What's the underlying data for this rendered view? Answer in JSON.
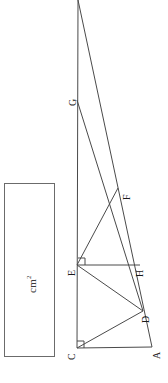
{
  "figure": {
    "stroke_color": "#4a4a4a",
    "background_color": "#ffffff",
    "rotation_degrees": -90,
    "vertices": [
      {
        "id": "T",
        "label": "",
        "x": 78,
        "y": 0,
        "label_x": 0,
        "label_y": 0,
        "shown": false
      },
      {
        "id": "G",
        "label": "G",
        "x": 77,
        "y": 100,
        "label_x": 68,
        "label_y": 106,
        "shown": true
      },
      {
        "id": "F",
        "label": "F",
        "x": 118,
        "y": 188,
        "label_x": 122,
        "label_y": 200,
        "shown": true
      },
      {
        "id": "E",
        "label": "E",
        "x": 77,
        "y": 265,
        "label_x": 67,
        "label_y": 276,
        "shown": true
      },
      {
        "id": "H",
        "label": "H",
        "x": 140,
        "y": 265,
        "label_x": 135,
        "label_y": 277,
        "shown": true
      },
      {
        "id": "D",
        "label": "D",
        "x": 143,
        "y": 311,
        "label_x": 141,
        "label_y": 323,
        "shown": true
      },
      {
        "id": "C",
        "label": "C",
        "x": 77,
        "y": 348,
        "label_x": 67,
        "label_y": 360,
        "shown": true
      },
      {
        "id": "A",
        "label": "A",
        "x": 152,
        "y": 347,
        "label_x": 152,
        "label_y": 359,
        "shown": true
      }
    ],
    "segments": [
      {
        "name": "vertical-axis-T-to-C",
        "x1": 78,
        "y1": 0,
        "x2": 77,
        "y2": 348
      },
      {
        "name": "diagonal-T-to-A",
        "x1": 78,
        "y1": 0,
        "x2": 152,
        "y2": 347
      },
      {
        "name": "diagonal-G-to-D",
        "x1": 77,
        "y1": 100,
        "x2": 143,
        "y2": 311
      },
      {
        "name": "segment-E-to-F",
        "x1": 77,
        "y1": 265,
        "x2": 118,
        "y2": 188
      },
      {
        "name": "segment-E-to-H",
        "x1": 77,
        "y1": 265,
        "x2": 140,
        "y2": 265
      },
      {
        "name": "segment-E-to-D",
        "x1": 77,
        "y1": 265,
        "x2": 143,
        "y2": 311
      },
      {
        "name": "segment-C-to-D",
        "x1": 77,
        "y1": 348,
        "x2": 143,
        "y2": 311
      },
      {
        "name": "base-C-to-A",
        "x1": 77,
        "y1": 348,
        "x2": 152,
        "y2": 347
      }
    ],
    "right_angle_marks": [
      {
        "name": "right-angle-at-C",
        "points": "77,341 84,341 84,348"
      },
      {
        "name": "right-angle-at-E",
        "points": "78,258 85,258 85,265"
      }
    ]
  },
  "answer_box": {
    "name": "answer-input-box",
    "x": 4,
    "y": 183,
    "width": 51,
    "height": 174,
    "unit_label": "cm",
    "unit_exponent": "2",
    "value": "",
    "placeholder": ""
  }
}
